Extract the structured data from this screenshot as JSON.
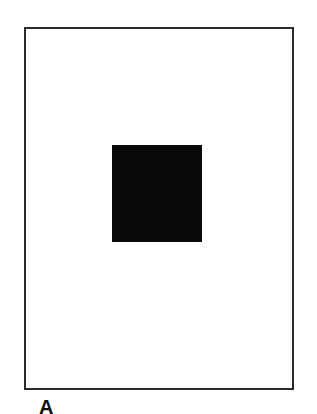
{
  "figure": {
    "panel_label": "A",
    "frame_color": "#2a2a2a",
    "square_color": "#0a0a0a",
    "background": "#ffffff"
  }
}
